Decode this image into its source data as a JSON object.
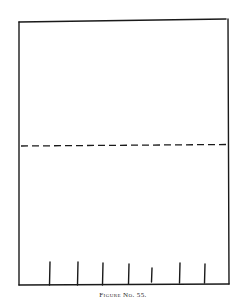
{
  "figure": {
    "caption": "Figure No. 55.",
    "stroke_color": "#1a1a1a",
    "background_color": "#ffffff",
    "rectangle": {
      "left": 19,
      "top": 20,
      "right": 229,
      "bottom": 285
    },
    "fold_line": {
      "style": "dashed",
      "y": 145,
      "x1": 21,
      "x2": 228
    },
    "tick_marks": [
      {
        "x": 50,
        "top": 262,
        "bottom": 285
      },
      {
        "x": 78,
        "top": 262,
        "bottom": 285
      },
      {
        "x": 103,
        "top": 263,
        "bottom": 285
      },
      {
        "x": 129,
        "top": 264,
        "bottom": 284
      },
      {
        "x": 152,
        "top": 268,
        "bottom": 282
      },
      {
        "x": 180,
        "top": 263,
        "bottom": 283
      },
      {
        "x": 205,
        "top": 264,
        "bottom": 283
      }
    ]
  }
}
